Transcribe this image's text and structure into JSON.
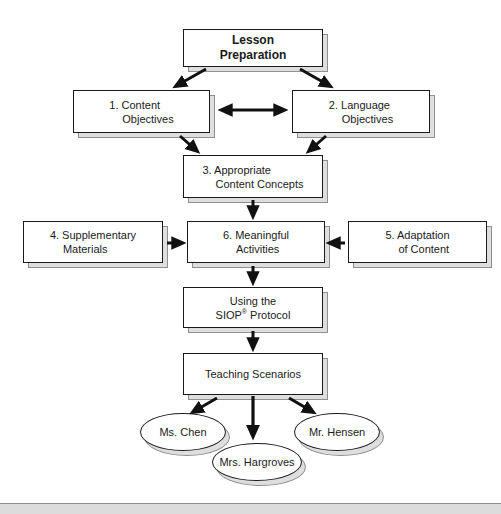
{
  "diagram": {
    "title_box": {
      "line1": "Lesson",
      "line2": "Preparation"
    },
    "boxes": {
      "content_objectives": {
        "line1": "1. Content",
        "line2": "Objectives"
      },
      "language_objectives": {
        "line1": "2. Language",
        "line2": "Objectives"
      },
      "content_concepts": {
        "line1": "3. Appropriate",
        "line2": "Content Concepts"
      },
      "supplementary_materials": {
        "line1": "4. Supplementary",
        "line2": "Materials"
      },
      "adaptation_of_content": {
        "line1": "5. Adaptation",
        "line2": "of Content"
      },
      "meaningful_activities": {
        "line1": "6. Meaningful",
        "line2": "Activities"
      },
      "siop_protocol": {
        "line1": "Using the",
        "line2_pre": "SIOP",
        "line2_sup": "®",
        "line2_post": " Protocol"
      },
      "teaching_scenarios": {
        "line1": "Teaching Scenarios"
      }
    },
    "ovals": {
      "chen": {
        "label": "Ms. Chen"
      },
      "hargroves": {
        "label": "Mrs. Hargroves"
      },
      "hensen": {
        "label": "Mr. Hensen"
      }
    },
    "colors": {
      "box_fill": "#ffffff",
      "box_border": "#1a1a1a",
      "shadow_fill": "#dedede",
      "shadow_border": "#8f8f8f",
      "arrow": "#111111",
      "footer_bar": "#dcdcdc"
    }
  }
}
